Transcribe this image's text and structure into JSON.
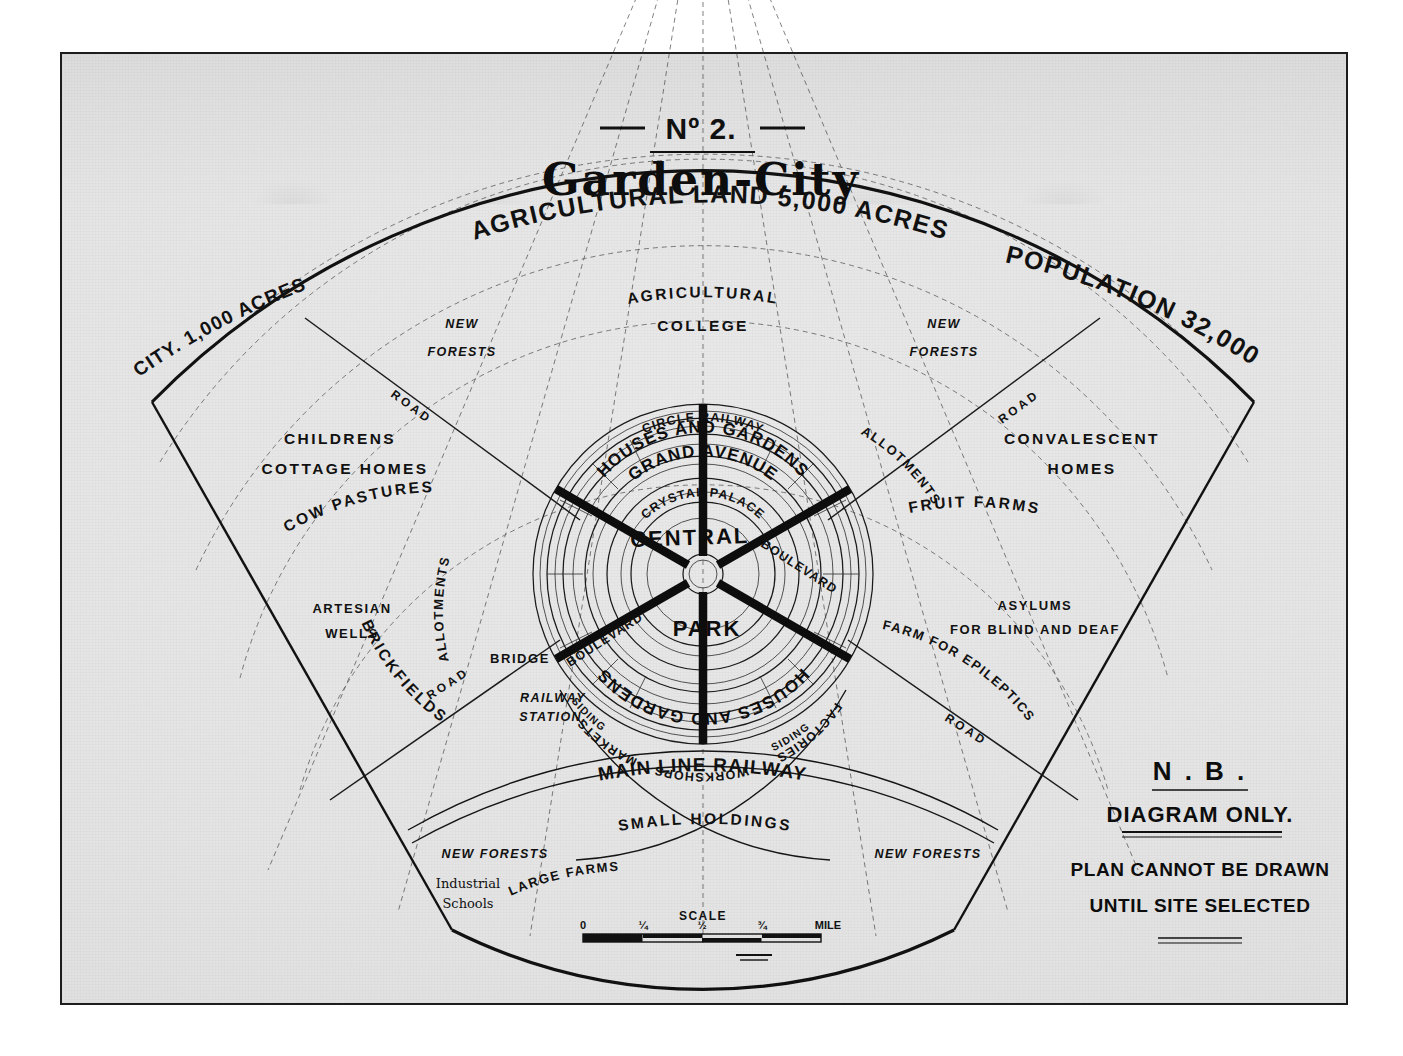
{
  "title": {
    "number": "Nº 2.",
    "name": "Garden-City"
  },
  "arcs": {
    "city": "CITY. 1,000 ACRES",
    "agricultural_land": "AGRICULTURAL LAND 5,000 ACRES",
    "population": "POPULATION 32,000",
    "main_line_railway": "MAIN LINE RAILWAY"
  },
  "outer_zones": {
    "agricultural_college_1": "AGRICULTURAL",
    "agricultural_college_2": "COLLEGE",
    "new_forests_left": "NEW",
    "new_forests_left2": "FORESTS",
    "new_forests_right": "NEW",
    "new_forests_right2": "FORESTS",
    "childrens": "CHILDRENS",
    "cottage_homes": "COTTAGE  HOMES",
    "cow_pastures": "COW PASTURES",
    "artesian": "ARTESIAN",
    "wells": "WELLS",
    "brickfields": "BRICKFIELDS",
    "convalescent": "CONVALESCENT",
    "homes": "HOMES",
    "fruit_farms": "FRUIT   FARMS",
    "asylums": "ASYLUMS",
    "asylums2": "FOR BLIND AND DEAF",
    "farm_epileptics": "FARM FOR EPILEPTICS",
    "allotments_left": "ALLOTMENTS",
    "allotments_right": "ALLOTMENTS",
    "small_holdings": "SMALL HOLDINGS",
    "large_farms": "LARGE FARMS",
    "new_forests_bl": "NEW FORESTS",
    "new_forests_br": "NEW FORESTS",
    "industrial_schools_1": "Industrial",
    "industrial_schools_2": "Schools"
  },
  "roads": {
    "road_nw": "ROAD",
    "road_ne": "ROAD",
    "road_sw": "ROAD",
    "road_se": "ROAD",
    "bridge": "BRIDGE",
    "railway_station_1": "RAILWAY",
    "railway_station_2": "STATION.",
    "siding_left": "SIDING",
    "siding_right": "SIDING"
  },
  "core": {
    "central": "CENTRAL",
    "park": "PARK",
    "crystal_palace": "CRYSTAL PALACE",
    "grand_avenue": "GRAND AVENUE",
    "houses_gardens_top": "HOUSES AND GARDENS",
    "houses_gardens_bottom": "HOUSES AND GARDENS",
    "circle_railway": "CIRCLE   RAILWAY",
    "factories": "FACTORIES",
    "workshops": "WORKSHOPS",
    "markets": "MARKETS",
    "boulevard_ne": "BOULEVARD",
    "boulevard_sw": "BOULEVARD"
  },
  "scale": {
    "label": "SCALE",
    "ticks": [
      "0",
      "¼",
      "½",
      "¾"
    ],
    "unit": "MILE"
  },
  "note": {
    "heading": "N . B .",
    "line1": "DIAGRAM  ONLY.",
    "line2": "PLAN CANNOT BE DRAWN",
    "line3": "UNTIL SITE SELECTED"
  },
  "colors": {
    "ink": "#111111",
    "paper": "#e6e6e6",
    "border": "#1d1d1d"
  }
}
